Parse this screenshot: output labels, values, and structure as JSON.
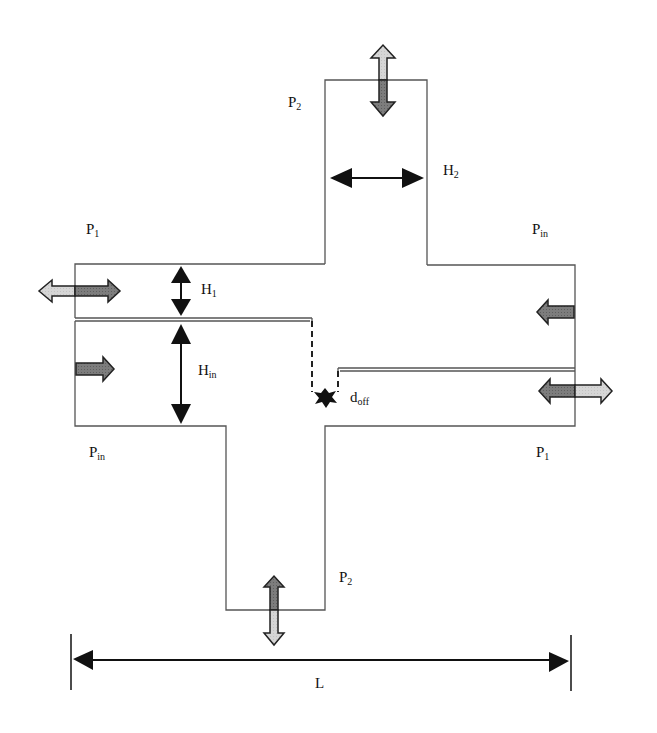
{
  "diagram": {
    "type": "cross-junction channel schematic",
    "labels": {
      "p2_top": {
        "main": "P",
        "sub": "2"
      },
      "h2": {
        "main": "H",
        "sub": "2"
      },
      "p1_left": {
        "main": "P",
        "sub": "1"
      },
      "pin_right": {
        "main": "P",
        "sub": "in"
      },
      "h1": {
        "main": "H",
        "sub": "1"
      },
      "hin": {
        "main": "H",
        "sub": "in"
      },
      "doff": {
        "main": "d",
        "sub": "off"
      },
      "pin_left": {
        "main": "P",
        "sub": "in"
      },
      "p1_right": {
        "main": "P",
        "sub": "1"
      },
      "p2_bottom": {
        "main": "P",
        "sub": "2"
      },
      "length": {
        "main": "L",
        "sub": ""
      }
    },
    "colors": {
      "outline": "#555555",
      "dark_fill": "#7a7a7a",
      "light_fill": "#d4d4d4",
      "arrow_black": "#111111"
    }
  }
}
